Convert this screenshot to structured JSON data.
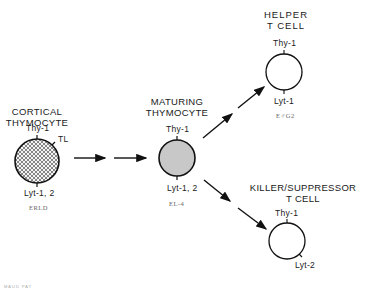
{
  "diagram": {
    "stages": [
      {
        "title_line1": "CORTICAL",
        "title_line2": "THYMOCYTE",
        "markers": [
          "Thy-1",
          "TL",
          "Lyt-1, 2"
        ],
        "cell_line": "ERLD",
        "fill": "crosshatch"
      },
      {
        "title_line1": "MATURING",
        "title_line2": "THYMOCYTE",
        "markers": [
          "Thy-1",
          "Lyt-1, 2"
        ],
        "cell_line": "EL-4",
        "fill": "#c8c8c8"
      },
      {
        "title_line1": "HELPER",
        "title_line2": "T CELL",
        "markers": [
          "Thy-1",
          "Lyt-1"
        ],
        "cell_line": "E♂G2",
        "fill": "#ffffff"
      },
      {
        "title_line1": "KILLER/SUPPRESSOR",
        "title_line2": "T CELL",
        "markers": [
          "Thy-1",
          "Lyt-2"
        ],
        "cell_line": "",
        "fill": "#ffffff"
      }
    ],
    "footer": "MAUD PAT"
  }
}
